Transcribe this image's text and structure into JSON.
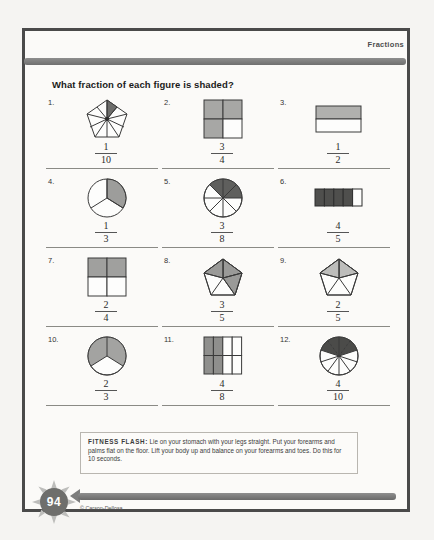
{
  "page": {
    "header_label": "Fractions",
    "title": "What fraction of each figure is shaded?",
    "page_number": "94",
    "copyright": "© Carson-Dellosa"
  },
  "fitness_flash": {
    "label": "FITNESS FLASH:",
    "text": " Lie on your stomach with your legs straight. Put your forearms and palms flat on the floor. Lift your body up and balance on your forearms and toes. Do this for 10 seconds."
  },
  "colors": {
    "shade_light": "#b6b6b4",
    "shade_mid": "#9a9a98",
    "shade_dark": "#555555",
    "outline": "#3a3a3a",
    "paper": "#fbfaf8",
    "border": "#4a4a4a",
    "bar": "#7d7d7d"
  },
  "problems": [
    {
      "number": "1.",
      "figure": "pentagon-10-wedges",
      "parts": 10,
      "shaded": 1,
      "numerator": "1",
      "denominator": "10"
    },
    {
      "number": "2.",
      "figure": "square-2x2-grid",
      "parts": 4,
      "shaded": 3,
      "numerator": "3",
      "denominator": "4"
    },
    {
      "number": "3.",
      "figure": "rectangle-2-rows",
      "parts": 2,
      "shaded": 1,
      "numerator": "1",
      "denominator": "2"
    },
    {
      "number": "4.",
      "figure": "circle-3-sectors",
      "parts": 3,
      "shaded": 1,
      "numerator": "1",
      "denominator": "3"
    },
    {
      "number": "5.",
      "figure": "circle-8-sectors",
      "parts": 8,
      "shaded": 3,
      "numerator": "3",
      "denominator": "8"
    },
    {
      "number": "6.",
      "figure": "rectangle-5-columns",
      "parts": 5,
      "shaded": 4,
      "numerator": "4",
      "denominator": "5"
    },
    {
      "number": "7.",
      "figure": "square-2x2-grid",
      "parts": 4,
      "shaded": 2,
      "numerator": "2",
      "denominator": "4"
    },
    {
      "number": "8.",
      "figure": "pentagon-5-triangles",
      "parts": 5,
      "shaded": 3,
      "numerator": "3",
      "denominator": "5"
    },
    {
      "number": "9.",
      "figure": "pentagon-5-triangles",
      "parts": 5,
      "shaded": 2,
      "numerator": "2",
      "denominator": "5"
    },
    {
      "number": "10.",
      "figure": "circle-3-sectors",
      "parts": 3,
      "shaded": 2,
      "numerator": "2",
      "denominator": "3"
    },
    {
      "number": "11.",
      "figure": "rectangle-4x2-grid",
      "parts": 8,
      "shaded": 4,
      "numerator": "4",
      "denominator": "8"
    },
    {
      "number": "12.",
      "figure": "circle-10-sectors",
      "parts": 10,
      "shaded": 4,
      "numerator": "4",
      "denominator": "10"
    }
  ]
}
